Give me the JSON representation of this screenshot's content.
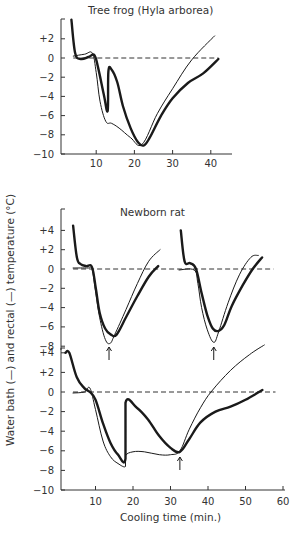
{
  "figure": {
    "ylabel": "Water bath (—) and rectal (—) temperature (°C)",
    "xlabel": "Cooling time (min.)",
    "panel_titles": [
      "Tree frog (Hyla arborea)",
      "Newborn rat"
    ],
    "colors": {
      "ink": "#1a1a1a",
      "axis": "#333333",
      "background": "#ffffff"
    }
  },
  "chart_data": [
    {
      "type": "line",
      "title": "Tree frog (Hyla arborea)",
      "xlabel": "",
      "ylabel": "Water bath and rectal temperature (°C)",
      "xlim": [
        0,
        45
      ],
      "ylim": [
        -10,
        4
      ],
      "xticks": [
        10,
        20,
        30,
        40
      ],
      "yticks": [
        "+2",
        "0",
        "-2",
        "-4",
        "-6",
        "-8",
        "-10"
      ],
      "reference_line": {
        "y": 0,
        "style": "dashed",
        "x_range": [
          4,
          42
        ]
      },
      "series": [
        {
          "name": "Water bath",
          "style": "thin",
          "x": [
            4,
            7,
            9,
            10,
            11,
            12.5,
            14,
            16,
            19,
            22,
            26,
            30,
            35,
            41
          ],
          "y": [
            0.2,
            0.4,
            0.5,
            -1.5,
            -4.5,
            -6.6,
            -6.8,
            -7.3,
            -8.3,
            -9.0,
            -5.8,
            -3.2,
            -0.2,
            2.3
          ]
        },
        {
          "name": "Rectal",
          "style": "thick",
          "x": [
            3.5,
            4.5,
            6,
            8,
            9.5,
            10.5,
            12,
            13,
            13.2,
            14,
            15.5,
            17,
            19,
            21,
            22.5,
            24,
            27,
            30,
            34,
            38,
            42
          ],
          "y": [
            4.0,
            0.5,
            -0.1,
            0.1,
            0.3,
            -1.0,
            -3.8,
            -5.5,
            -1.4,
            -1.2,
            -2.5,
            -5.0,
            -7.3,
            -8.8,
            -9.1,
            -8.3,
            -6.0,
            -4.2,
            -2.6,
            -1.6,
            -0.1
          ]
        }
      ]
    },
    {
      "type": "line",
      "title": "Newborn rat",
      "xlabel": "",
      "ylabel": "Water bath and rectal temperature (°C)",
      "ylim": [
        -8,
        6
      ],
      "yticks": [
        "+4",
        "+2",
        "0",
        "-2",
        "-4",
        "-6",
        "-8"
      ],
      "reference_line": {
        "y": 0,
        "style": "dashed"
      },
      "arrows_at_x": [
        13.5,
        41.2
      ],
      "series": [
        {
          "name": "Water bath (run 1)",
          "style": "thin",
          "x": [
            4,
            8,
            9,
            10,
            11,
            12.5,
            13.8,
            15,
            18,
            21,
            24,
            27
          ],
          "y": [
            0.1,
            0.1,
            0.0,
            -2.5,
            -5.0,
            -7.3,
            -7.7,
            -6.8,
            -4.2,
            -1.5,
            0.8,
            2.0
          ]
        },
        {
          "name": "Rectal (run 1)",
          "style": "thick",
          "x": [
            4,
            5,
            6,
            7.5,
            9,
            10,
            11,
            12.5,
            14,
            15.5,
            18,
            21,
            24,
            26.5
          ],
          "y": [
            4.5,
            1.2,
            0.5,
            0.3,
            0.2,
            -2.0,
            -4.5,
            -6.2,
            -6.8,
            -6.8,
            -5.0,
            -2.8,
            -0.8,
            0.3
          ]
        },
        {
          "name": "Water bath (run 2)",
          "style": "thin",
          "x": [
            32,
            36,
            37,
            38,
            39.5,
            41.2,
            42.5,
            45,
            48,
            51,
            53
          ],
          "y": [
            -0.1,
            -0.1,
            -1.5,
            -4.0,
            -6.3,
            -7.6,
            -6.5,
            -3.5,
            -0.6,
            1.2,
            1.4
          ]
        },
        {
          "name": "Rectal (run 2)",
          "style": "thick",
          "x": [
            32.5,
            33.5,
            35,
            36.5,
            38,
            39.5,
            41,
            42.5,
            44,
            46,
            49,
            51.5,
            54
          ],
          "y": [
            4.0,
            0.8,
            0.6,
            0.0,
            -2.5,
            -4.8,
            -6.2,
            -6.4,
            -5.8,
            -3.8,
            -1.6,
            0.0,
            1.2
          ]
        }
      ]
    },
    {
      "type": "line",
      "title": "",
      "xlabel": "Cooling time (min.)",
      "ylabel": "Water bath and rectal temperature (°C)",
      "xlim": [
        0,
        60
      ],
      "ylim": [
        -10,
        4
      ],
      "xticks": [
        10,
        20,
        30,
        40,
        50,
        60
      ],
      "yticks": [
        "+4",
        "+2",
        "0",
        "-2",
        "-4",
        "-6",
        "-8",
        "-10"
      ],
      "reference_line": {
        "y": 0,
        "style": "dashed",
        "x_range": [
          4,
          58
        ]
      },
      "arrows_at_x": [
        32.5
      ],
      "series": [
        {
          "name": "Water bath",
          "style": "thin",
          "x": [
            4,
            7,
            8.5,
            10,
            12,
            14,
            16,
            18,
            18,
            20,
            23,
            27,
            30,
            32.5,
            35,
            38,
            41,
            46,
            51,
            55
          ],
          "y": [
            -0.1,
            0.0,
            0.4,
            -1.8,
            -5.0,
            -6.6,
            -7.3,
            -7.6,
            -6.5,
            -6.1,
            -6.1,
            -6.4,
            -6.4,
            -6.0,
            -3.8,
            -1.6,
            0.1,
            2.2,
            3.8,
            4.8
          ]
        },
        {
          "name": "Rectal",
          "style": "thick",
          "x": [
            2,
            3,
            5,
            7,
            8.5,
            10,
            12,
            14,
            16,
            18,
            18,
            21,
            24,
            27,
            30,
            32.5,
            35,
            38,
            42,
            46,
            50,
            54.5
          ],
          "y": [
            4.0,
            4.0,
            1.5,
            0.4,
            0.0,
            -0.8,
            -3.2,
            -5.2,
            -6.4,
            -6.8,
            -1.1,
            -1.6,
            -2.8,
            -4.5,
            -5.7,
            -6.1,
            -4.8,
            -3.1,
            -2.0,
            -1.5,
            -0.8,
            0.2
          ]
        }
      ]
    }
  ]
}
